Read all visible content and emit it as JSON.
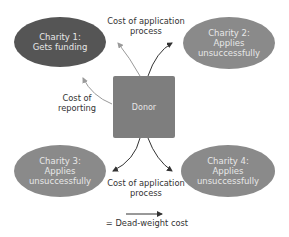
{
  "diagram": {
    "center": {
      "label": "Donor",
      "color": "#7e7e7e"
    },
    "nodes": [
      {
        "id": "charity1",
        "line1": "Charity 1:",
        "line2": "Gets funding",
        "line3": "",
        "color": "#555555"
      },
      {
        "id": "charity2",
        "line1": "Charity 2:",
        "line2": "Applies",
        "line3": "unsuccessfully",
        "color": "#8a8a8a"
      },
      {
        "id": "charity3",
        "line1": "Charity 3:",
        "line2": "Applies",
        "line3": "unsuccessfully",
        "color": "#8a8a8a"
      },
      {
        "id": "charity4",
        "line1": "Charity 4:",
        "line2": "Applies",
        "line3": "unsuccessfully",
        "color": "#8a8a8a"
      }
    ],
    "labels": {
      "top": {
        "line1": "Cost of application",
        "line2": "process"
      },
      "left": {
        "line1": "Cost of",
        "line2": "reporting"
      },
      "bottom": {
        "line1": "Cost of application",
        "line2": "process"
      }
    },
    "legend": {
      "text": "= Dead-weight cost"
    },
    "colors": {
      "deadweight_arrow": "#333333",
      "normal_arrow": "#9a9a9a"
    }
  }
}
